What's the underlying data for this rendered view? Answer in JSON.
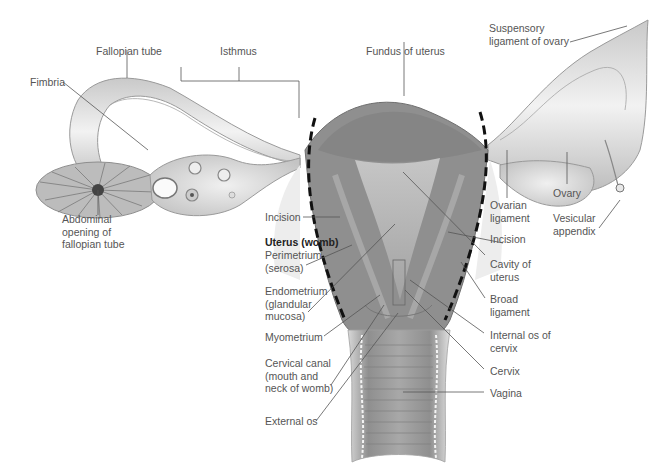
{
  "diagram": {
    "subject": "Uterus (womb)",
    "labels": {
      "fallopian_tube": "Fallopian tube",
      "isthmus": "Isthmus",
      "fundus": "Fundus of uterus",
      "suspensory_ligament": "Suspensory\nligament of ovary",
      "fimbria": "Fimbria",
      "abdominal_opening": "Abdominal\nopening of\nfallopian tube",
      "incision_left": "Incision",
      "uterus_heading": "Uterus (womb)",
      "perimetrium": "Perimetrium\n(serosa)",
      "endometrium": "Endometrium\n(glandular\nmucosa)",
      "myometrium": "Myometrium",
      "cervical_canal": "Cervical canal\n(mouth and\nneck of womb)",
      "external_os": "External os",
      "ovarian_ligament": "Ovarian\nligament",
      "ovary": "Ovary",
      "vesicular_appendix": "Vesicular\nappendix",
      "incision_right": "Incision",
      "cavity": "Cavity of\nuterus",
      "broad_ligament": "Broad\nligament",
      "internal_os": "Internal os of\ncervix",
      "cervix": "Cervix",
      "vagina": "Vagina"
    },
    "colors": {
      "tissue_dark": "#8a8a8a",
      "tissue_mid": "#b0b0b0",
      "tissue_light": "#dcdcdc",
      "incision_line": "#111111",
      "leader_line": "#555555"
    }
  }
}
